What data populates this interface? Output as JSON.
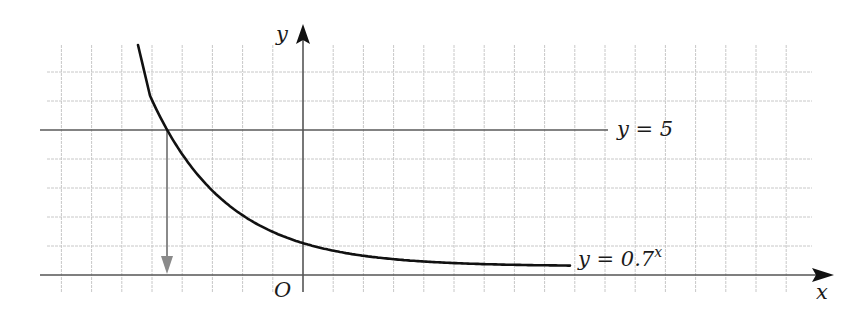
{
  "chart_data": {
    "type": "line",
    "title": "",
    "xlabel": "x",
    "ylabel": "y",
    "origin_label": "O",
    "grid": true,
    "grid_unit": 1,
    "xlim": [
      -8,
      16.8
    ],
    "ylim": [
      -0.6,
      8.2
    ],
    "series": [
      {
        "name": "y = 0.7^x",
        "kind": "curve",
        "function": "0.7^x",
        "label_text": "y = 0.7",
        "label_sup": "x",
        "x_range": [
          -5.5,
          8.8
        ],
        "color": "#111111"
      },
      {
        "name": "y = 5",
        "kind": "horizontal_line",
        "y": 5,
        "label_text": "y = 5",
        "x_range": [
          -8.7,
          10.1
        ],
        "color": "#555555"
      }
    ],
    "annotations": [
      {
        "type": "arrow",
        "description": "vertical arrow from intersection of y=0.7^x and y=5 down to x-axis",
        "x": -4.51,
        "from_y": 5,
        "to_y": 0,
        "color": "#8a8a8a"
      }
    ],
    "colors": {
      "grid": "#c8c8c8",
      "axis": "#555555",
      "curve": "#111111",
      "arrow": "#8a8a8a"
    }
  }
}
